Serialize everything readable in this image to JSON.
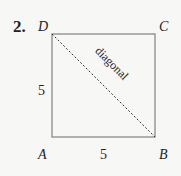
{
  "problem": {
    "number": "2."
  },
  "square": {
    "vertices": {
      "A": "A",
      "B": "B",
      "C": "C",
      "D": "D"
    },
    "side_left": "5",
    "side_bottom": "5",
    "diagonal_label": "diagonal",
    "colors": {
      "side": "#8a8a8a",
      "diagonal": "#333333"
    }
  }
}
